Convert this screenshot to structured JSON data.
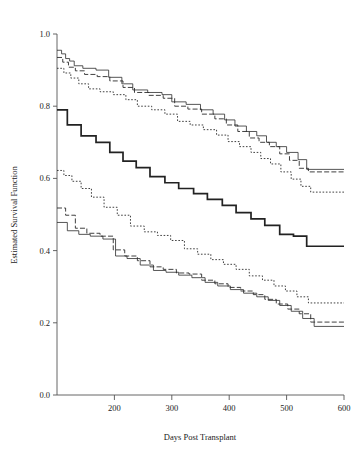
{
  "chart_data": {
    "type": "line",
    "title": "",
    "xlabel": "Days Post Transplant",
    "ylabel": "Estimated Survival Function",
    "xlim": [
      100,
      600
    ],
    "ylim": [
      0.0,
      1.0
    ],
    "xticks": [
      200,
      300,
      400,
      500,
      600
    ],
    "xtick_labels": [
      "200",
      "300",
      "400",
      "500",
      "600"
    ],
    "yticks": [
      0.0,
      0.2,
      0.4,
      0.6,
      0.8,
      1.0
    ],
    "ytick_labels": [
      "0.0",
      "0.2",
      "0.4",
      "0.6",
      "0.8",
      "1.0"
    ],
    "grid": false,
    "legend": "none",
    "step_style": "post",
    "series": [
      {
        "name": "upper-band-solid-thin",
        "line_style": "solid-thin",
        "x": [
          100,
          108,
          115,
          122,
          130,
          145,
          168,
          190,
          213,
          232,
          258,
          283,
          300,
          325,
          350,
          372,
          392,
          410,
          430,
          448,
          465,
          482,
          500,
          520,
          535,
          600
        ],
        "y": [
          0.955,
          0.945,
          0.932,
          0.925,
          0.912,
          0.905,
          0.9,
          0.88,
          0.862,
          0.845,
          0.838,
          0.832,
          0.812,
          0.805,
          0.79,
          0.778,
          0.762,
          0.745,
          0.73,
          0.718,
          0.7,
          0.688,
          0.672,
          0.652,
          0.625,
          0.625
        ]
      },
      {
        "name": "upper-band-dashed",
        "line_style": "dashed",
        "x": [
          100,
          110,
          120,
          132,
          148,
          170,
          192,
          215,
          235,
          260,
          285,
          305,
          328,
          352,
          375,
          395,
          415,
          435,
          452,
          470,
          488,
          505,
          522,
          538,
          600
        ],
        "y": [
          0.935,
          0.922,
          0.908,
          0.898,
          0.888,
          0.882,
          0.87,
          0.852,
          0.838,
          0.83,
          0.822,
          0.8,
          0.792,
          0.778,
          0.765,
          0.748,
          0.73,
          0.712,
          0.7,
          0.688,
          0.668,
          0.65,
          0.628,
          0.618,
          0.618
        ]
      },
      {
        "name": "upper-band-dotted",
        "line_style": "dotted",
        "x": [
          100,
          112,
          124,
          138,
          155,
          175,
          198,
          220,
          240,
          265,
          288,
          310,
          332,
          355,
          378,
          398,
          418,
          438,
          455,
          472,
          490,
          508,
          525,
          542,
          600
        ],
        "y": [
          0.905,
          0.892,
          0.878,
          0.862,
          0.848,
          0.84,
          0.832,
          0.818,
          0.8,
          0.79,
          0.778,
          0.758,
          0.748,
          0.735,
          0.72,
          0.702,
          0.688,
          0.672,
          0.655,
          0.64,
          0.618,
          0.598,
          0.578,
          0.562,
          0.562
        ]
      },
      {
        "name": "center-estimate-solid-bold",
        "line_style": "solid-bold",
        "x": [
          100,
          118,
          142,
          168,
          192,
          215,
          238,
          262,
          288,
          312,
          338,
          362,
          388,
          412,
          438,
          462,
          488,
          512,
          535,
          600
        ],
        "y": [
          0.79,
          0.748,
          0.718,
          0.7,
          0.672,
          0.648,
          0.63,
          0.605,
          0.588,
          0.572,
          0.558,
          0.542,
          0.525,
          0.505,
          0.488,
          0.47,
          0.445,
          0.44,
          0.412,
          0.412
        ]
      },
      {
        "name": "lower-band-dotted",
        "line_style": "dotted",
        "x": [
          100,
          112,
          126,
          142,
          160,
          182,
          205,
          228,
          252,
          275,
          298,
          322,
          345,
          368,
          390,
          412,
          435,
          458,
          478,
          498,
          518,
          538,
          600
        ],
        "y": [
          0.622,
          0.608,
          0.592,
          0.572,
          0.548,
          0.52,
          0.498,
          0.468,
          0.452,
          0.442,
          0.428,
          0.405,
          0.39,
          0.375,
          0.362,
          0.348,
          0.33,
          0.318,
          0.302,
          0.288,
          0.272,
          0.255,
          0.255
        ]
      },
      {
        "name": "lower-band-dashed",
        "line_style": "dashed",
        "x": [
          100,
          115,
          132,
          152,
          175,
          198,
          218,
          240,
          262,
          285,
          308,
          330,
          352,
          375,
          398,
          420,
          442,
          462,
          482,
          502,
          522,
          542,
          600
        ],
        "y": [
          0.518,
          0.498,
          0.462,
          0.448,
          0.44,
          0.402,
          0.385,
          0.372,
          0.355,
          0.348,
          0.338,
          0.335,
          0.318,
          0.308,
          0.298,
          0.288,
          0.278,
          0.265,
          0.252,
          0.238,
          0.225,
          0.202,
          0.202
        ]
      },
      {
        "name": "lower-band-solid-thin",
        "line_style": "solid-thin",
        "x": [
          100,
          118,
          138,
          158,
          180,
          202,
          222,
          245,
          268,
          290,
          312,
          335,
          358,
          380,
          402,
          425,
          448,
          468,
          488,
          508,
          528,
          548,
          600
        ],
        "y": [
          0.478,
          0.455,
          0.445,
          0.44,
          0.432,
          0.385,
          0.378,
          0.36,
          0.345,
          0.34,
          0.332,
          0.325,
          0.312,
          0.302,
          0.292,
          0.282,
          0.272,
          0.262,
          0.248,
          0.232,
          0.212,
          0.19,
          0.19
        ]
      }
    ]
  }
}
